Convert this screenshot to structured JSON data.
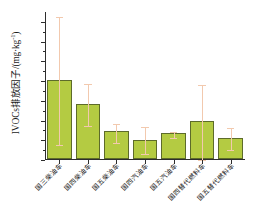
{
  "chart_data": {
    "type": "bar",
    "title": "",
    "xlabel": "",
    "ylabel": "IVOCs排放因子/(mg·kg⁻¹)",
    "ylabel_main": "IVOCs排放因子/(mg·kg",
    "ylabel_sup": "-1",
    "ylabel_tail": ")",
    "ylim": [
      0,
      1500
    ],
    "ymajor_step": 200,
    "yminor_step": 100,
    "grid": false,
    "legend": "none",
    "categories": [
      "国三柴油车",
      "国四柴油车",
      "国五柴油车",
      "国四汽油车",
      "国五汽油车",
      "国四替代燃料车",
      "国五替代燃料车"
    ],
    "tick_labels": [
      "0",
      "200",
      "400",
      "600",
      "800",
      "1000",
      "1200",
      "1400"
    ],
    "tick_values": [
      0,
      200,
      400,
      600,
      800,
      1000,
      1200,
      1400
    ],
    "values": [
      800,
      560,
      280,
      195,
      260,
      390,
      210
    ],
    "error_low": [
      150,
      345,
      170,
      60,
      225,
      0,
      100
    ],
    "error_high": [
      1450,
      775,
      365,
      335,
      280,
      765,
      320
    ],
    "series": [
      {
        "name": "IVOCs排放因子",
        "values": [
          800,
          560,
          280,
          195,
          260,
          390,
          210
        ]
      }
    ],
    "colors": {
      "bar_fill": "#b4cb42",
      "bar_edge": "#5d6b2a",
      "error_bar": "#f2c9ae",
      "axis": "#2d2d2d",
      "text": "#1a1a1a",
      "background": "#ffffff"
    }
  }
}
